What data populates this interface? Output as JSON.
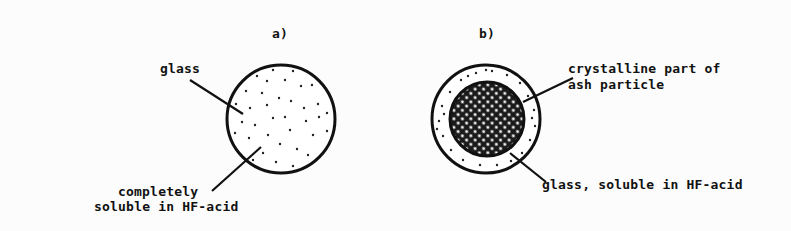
{
  "figure": {
    "panels": [
      {
        "id": "a",
        "title": "a)",
        "labels": {
          "glass": "glass",
          "soluble_line1": "completely",
          "soluble_line2": "soluble in HF-acid"
        }
      },
      {
        "id": "b",
        "title": "b)",
        "labels": {
          "crystalline_line1": "crystalline part of",
          "crystalline_line2": "ash particle",
          "glass": "glass, soluble in HF-acid"
        }
      }
    ],
    "colors": {
      "ink": "#111111",
      "background": "#fcfcfc"
    }
  }
}
